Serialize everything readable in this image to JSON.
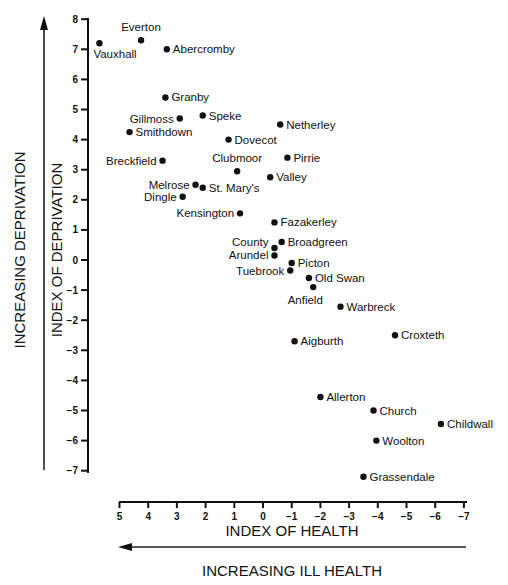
{
  "chart_data": {
    "type": "scatter",
    "title": "",
    "xlabel": "INDEX OF HEALTH",
    "ylabel": "INDEX OF DEPRIVATION",
    "x_direction_label": "INCREASING ILL HEALTH",
    "y_direction_label": "INCREASING DEPRIVATION",
    "xlim": [
      5,
      -7
    ],
    "ylim": [
      -7,
      8
    ],
    "x_reversed": true,
    "grid": false,
    "legend": null,
    "x_ticks": [
      5,
      4,
      3,
      2,
      1,
      0,
      -1,
      -2,
      -3,
      -4,
      -5,
      -6,
      -7
    ],
    "x_tick_labels": [
      "5",
      "4",
      "3",
      "2",
      "1",
      "0",
      "−1",
      "−2",
      "−3",
      "−4",
      "−5",
      "−6",
      "−7"
    ],
    "y_ticks": [
      8,
      7,
      6,
      5,
      4,
      3,
      2,
      1,
      0,
      -1,
      -2,
      -3,
      -4,
      -5,
      -6,
      -7
    ],
    "y_tick_labels": [
      "8",
      "7",
      "6",
      "5",
      "4",
      "3",
      "2",
      "1",
      "0",
      "−1",
      "−2",
      "−3",
      "−4",
      "−5",
      "−6",
      "−7"
    ],
    "points": [
      {
        "label": "Vauxhall",
        "x": 5.7,
        "y": 7.2,
        "anchor": "below-right"
      },
      {
        "label": "Everton",
        "x": 4.25,
        "y": 7.3,
        "anchor": "above"
      },
      {
        "label": "Abercromby",
        "x": 3.35,
        "y": 7.0,
        "anchor": "right"
      },
      {
        "label": "Granby",
        "x": 3.4,
        "y": 5.4,
        "anchor": "right"
      },
      {
        "label": "Gillmoss",
        "x": 2.9,
        "y": 4.7,
        "anchor": "left"
      },
      {
        "label": "Speke",
        "x": 2.1,
        "y": 4.8,
        "anchor": "right"
      },
      {
        "label": "Smithdown",
        "x": 4.65,
        "y": 4.25,
        "anchor": "right"
      },
      {
        "label": "Dovecot",
        "x": 1.2,
        "y": 4.0,
        "anchor": "right"
      },
      {
        "label": "Netherley",
        "x": -0.6,
        "y": 4.5,
        "anchor": "right"
      },
      {
        "label": "Breckfield",
        "x": 3.5,
        "y": 3.3,
        "anchor": "left"
      },
      {
        "label": "Clubmoor",
        "x": 0.9,
        "y": 2.95,
        "anchor": "above"
      },
      {
        "label": "Pirrie",
        "x": -0.85,
        "y": 3.4,
        "anchor": "right"
      },
      {
        "label": "Valley",
        "x": -0.25,
        "y": 2.75,
        "anchor": "right"
      },
      {
        "label": "Melrose",
        "x": 2.35,
        "y": 2.5,
        "anchor": "left"
      },
      {
        "label": "St. Mary's",
        "x": 2.1,
        "y": 2.4,
        "anchor": "right"
      },
      {
        "label": "Dingle",
        "x": 2.8,
        "y": 2.1,
        "anchor": "left"
      },
      {
        "label": "Kensington",
        "x": 0.8,
        "y": 1.55,
        "anchor": "left"
      },
      {
        "label": "Fazakerley",
        "x": -0.4,
        "y": 1.25,
        "anchor": "right"
      },
      {
        "label": "County",
        "x": -0.4,
        "y": 0.4,
        "anchor": "left-up"
      },
      {
        "label": "Broadgreen",
        "x": -0.65,
        "y": 0.6,
        "anchor": "right"
      },
      {
        "label": "Arundel",
        "x": -0.4,
        "y": 0.15,
        "anchor": "left"
      },
      {
        "label": "Picton",
        "x": -1.0,
        "y": -0.1,
        "anchor": "right"
      },
      {
        "label": "Tuebrook",
        "x": -0.95,
        "y": -0.35,
        "anchor": "left"
      },
      {
        "label": "Old Swan",
        "x": -1.6,
        "y": -0.6,
        "anchor": "right"
      },
      {
        "label": "Anfield",
        "x": -1.75,
        "y": -0.9,
        "anchor": "below"
      },
      {
        "label": "Warbreck",
        "x": -2.7,
        "y": -1.55,
        "anchor": "right"
      },
      {
        "label": "Croxteth",
        "x": -4.6,
        "y": -2.5,
        "anchor": "right"
      },
      {
        "label": "Aigburth",
        "x": -1.1,
        "y": -2.7,
        "anchor": "right"
      },
      {
        "label": "Allerton",
        "x": -2.0,
        "y": -4.55,
        "anchor": "right"
      },
      {
        "label": "Church",
        "x": -3.85,
        "y": -5.0,
        "anchor": "right"
      },
      {
        "label": "Childwall",
        "x": -6.2,
        "y": -5.45,
        "anchor": "right"
      },
      {
        "label": "Woolton",
        "x": -3.95,
        "y": -6.0,
        "anchor": "right"
      },
      {
        "label": "Grassendale",
        "x": -3.5,
        "y": -7.2,
        "anchor": "right"
      }
    ]
  },
  "layout": {
    "x_axis_y": 502,
    "x_zero_px": 263,
    "x_px_per_unit": 28.7,
    "y_axis_x": 88,
    "y_zero_px": 260,
    "y_px_per_unit": 30.1
  }
}
